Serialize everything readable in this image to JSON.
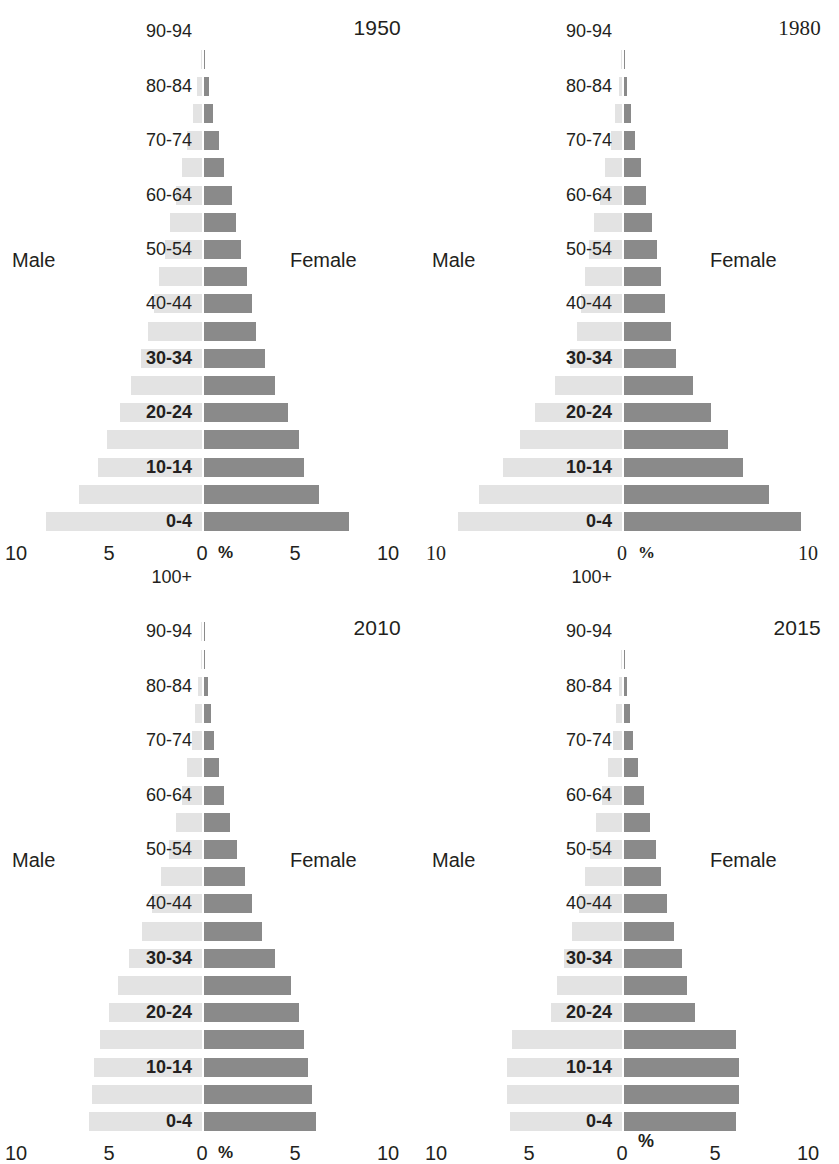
{
  "figure": {
    "age_groups": [
      "0-4",
      "5-9",
      "10-14",
      "15-19",
      "20-24",
      "25-29",
      "30-34",
      "35-39",
      "40-44",
      "45-49",
      "50-54",
      "55-59",
      "60-64",
      "65-69",
      "70-74",
      "75-79",
      "80-84",
      "85-89",
      "90-94",
      "95-99",
      "100+"
    ],
    "labeled_age_groups": [
      "0-4",
      "10-14",
      "20-24",
      "30-34",
      "40-44",
      "50-54",
      "60-64",
      "70-74",
      "80-84",
      "90-94",
      "100+"
    ],
    "bold_age_groups": [
      "0-4",
      "10-14",
      "20-24",
      "30-34"
    ],
    "legend": {
      "male": "Male",
      "female": "Female"
    },
    "axis_unit": "%",
    "colors": {
      "male_bar": "#e3e3e3",
      "female_bar": "#8a8a8a",
      "text": "#231f20",
      "background": "#ffffff"
    }
  },
  "chart_data": [
    {
      "type": "bar",
      "title": "1950",
      "xlabel": "%",
      "ylabel": "",
      "xlim": [
        -10,
        10
      ],
      "xticks": [
        "10",
        "5",
        "0",
        "5",
        "10"
      ],
      "xtick_values": [
        -10,
        -5,
        0,
        5,
        10
      ],
      "grid": false,
      "legend_position": "sides",
      "categories": [
        "0-4",
        "5-9",
        "10-14",
        "15-19",
        "20-24",
        "25-29",
        "30-34",
        "35-39",
        "40-44",
        "45-49",
        "50-54",
        "55-59",
        "60-64",
        "65-69",
        "70-74",
        "75-79",
        "80-84",
        "85-89",
        "90-94",
        "95-99",
        "100+"
      ],
      "series": [
        {
          "name": "Male",
          "values": [
            8.4,
            6.6,
            5.6,
            5.1,
            4.4,
            3.8,
            3.3,
            2.9,
            2.6,
            2.3,
            2.0,
            1.7,
            1.4,
            1.1,
            0.8,
            0.5,
            0.25,
            0.08,
            0.02,
            0.0,
            0.0
          ]
        },
        {
          "name": "Female",
          "values": [
            7.8,
            6.2,
            5.4,
            5.1,
            4.5,
            3.8,
            3.3,
            2.8,
            2.6,
            2.3,
            2.0,
            1.7,
            1.5,
            1.1,
            0.8,
            0.5,
            0.25,
            0.08,
            0.02,
            0.0,
            0.0
          ]
        }
      ]
    },
    {
      "type": "bar",
      "title": "1980",
      "xlabel": "%",
      "ylabel": "",
      "xlim": [
        -10,
        10
      ],
      "xticks": [
        "10",
        "0",
        "10"
      ],
      "xtick_values": [
        -10,
        0,
        10
      ],
      "grid": false,
      "legend_position": "sides",
      "categories": [
        "0-4",
        "5-9",
        "10-14",
        "15-19",
        "20-24",
        "25-29",
        "30-34",
        "35-39",
        "40-44",
        "45-49",
        "50-54",
        "55-59",
        "60-64",
        "65-69",
        "70-74",
        "75-79",
        "80-84",
        "85-89",
        "90-94",
        "95-99",
        "100+"
      ],
      "series": [
        {
          "name": "Male",
          "values": [
            8.8,
            7.7,
            6.4,
            5.5,
            4.7,
            3.6,
            2.8,
            2.4,
            2.2,
            2.0,
            1.8,
            1.5,
            1.2,
            0.9,
            0.6,
            0.35,
            0.18,
            0.06,
            0.02,
            0.0,
            0.0
          ]
        },
        {
          "name": "Female",
          "values": [
            9.5,
            7.8,
            6.4,
            5.6,
            4.7,
            3.7,
            2.8,
            2.5,
            2.2,
            2.0,
            1.8,
            1.5,
            1.2,
            0.9,
            0.6,
            0.35,
            0.18,
            0.06,
            0.02,
            0.0,
            0.0
          ]
        }
      ]
    },
    {
      "type": "bar",
      "title": "2010",
      "xlabel": "%",
      "ylabel": "",
      "xlim": [
        -10,
        10
      ],
      "xticks": [
        "10",
        "5",
        "0",
        "5",
        "10"
      ],
      "xtick_values": [
        -10,
        -5,
        0,
        5,
        10
      ],
      "grid": false,
      "legend_position": "sides",
      "categories": [
        "0-4",
        "5-9",
        "10-14",
        "15-19",
        "20-24",
        "25-29",
        "30-34",
        "35-39",
        "40-44",
        "45-49",
        "50-54",
        "55-59",
        "60-64",
        "65-69",
        "70-74",
        "75-79",
        "80-84",
        "85-89",
        "90-94",
        "95-99",
        "100+"
      ],
      "series": [
        {
          "name": "Male",
          "values": [
            6.1,
            5.9,
            5.8,
            5.5,
            5.0,
            4.5,
            3.9,
            3.2,
            2.7,
            2.2,
            1.8,
            1.4,
            1.1,
            0.8,
            0.55,
            0.35,
            0.2,
            0.08,
            0.03,
            0.01,
            0.0
          ]
        },
        {
          "name": "Female",
          "values": [
            6.0,
            5.8,
            5.6,
            5.4,
            5.1,
            4.7,
            3.8,
            3.1,
            2.6,
            2.2,
            1.8,
            1.4,
            1.1,
            0.8,
            0.55,
            0.35,
            0.2,
            0.08,
            0.03,
            0.01,
            0.0
          ]
        }
      ]
    },
    {
      "type": "bar",
      "title": "2015",
      "xlabel": "%",
      "ylabel": "",
      "xlim": [
        -10,
        10
      ],
      "xticks": [
        "10",
        "5",
        "0",
        "5",
        "10"
      ],
      "xtick_values": [
        -10,
        -5,
        0,
        5,
        10
      ],
      "grid": false,
      "legend_position": "sides",
      "categories": [
        "0-4",
        "5-9",
        "10-14",
        "15-19",
        "20-24",
        "25-29",
        "30-34",
        "35-39",
        "40-44",
        "45-49",
        "50-54",
        "55-59",
        "60-64",
        "65-69",
        "70-74",
        "75-79",
        "80-84",
        "85-89",
        "90-94",
        "95-99",
        "100+"
      ],
      "series": [
        {
          "name": "Male",
          "values": [
            6.0,
            6.2,
            6.2,
            5.9,
            3.8,
            3.5,
            3.1,
            2.7,
            2.3,
            2.0,
            1.7,
            1.4,
            1.1,
            0.75,
            0.5,
            0.3,
            0.15,
            0.06,
            0.02,
            0.0,
            0.0
          ]
        },
        {
          "name": "Female",
          "values": [
            6.0,
            6.2,
            6.2,
            6.0,
            3.8,
            3.4,
            3.1,
            2.7,
            2.3,
            2.0,
            1.7,
            1.4,
            1.1,
            0.75,
            0.5,
            0.3,
            0.15,
            0.06,
            0.02,
            0.0,
            0.0
          ]
        }
      ]
    }
  ]
}
